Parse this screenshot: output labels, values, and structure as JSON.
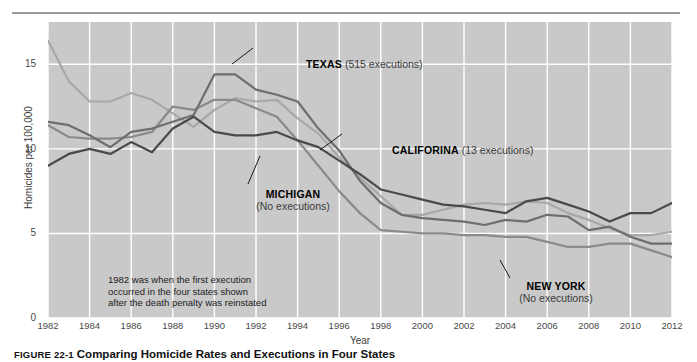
{
  "figure": {
    "caption_number": "FIGURE 22-1",
    "caption_text": "Comparing Homicide Rates and Executions in Four States"
  },
  "axes": {
    "y_title": "Homicides per 100,000",
    "x_title": "Year",
    "y_ticks": [
      "0",
      "5",
      "10",
      "15"
    ],
    "x_ticks": [
      "1982",
      "1984",
      "1986",
      "1988",
      "1990",
      "1992",
      "1994",
      "1996",
      "1998",
      "2000",
      "2002",
      "2004",
      "2006",
      "2008",
      "2010",
      "2012"
    ]
  },
  "annotations": {
    "texas": {
      "name": "TEXAS",
      "detail": "(515 executions)"
    },
    "california": {
      "name": "CALIFORINA",
      "detail": "(13 executions)"
    },
    "michigan": {
      "name": "MICHIGAN",
      "detail": "(No executions)"
    },
    "new_york": {
      "name": "NEW YORK",
      "detail": "(No executions)"
    },
    "note": "1982 was when the first execution\noccurred in the four states shown\nafter the death penalty was reinstated"
  },
  "colors": {
    "plot_background": "#c9c9c9",
    "gridline": "#ffffff",
    "texas": "#6e6e6e",
    "california": "#a8a8a8",
    "michigan": "#4a4a4a",
    "new_york": "#8a8a8a",
    "rule": "#9a9a9a"
  },
  "chart_data": {
    "type": "line",
    "title": "Comparing Homicide Rates and Executions in Four States",
    "xlabel": "Year",
    "ylabel": "Homicides per 100,000",
    "xlim": [
      1982,
      2012
    ],
    "ylim": [
      0,
      17.5
    ],
    "grid": true,
    "legend": "in-plot annotations",
    "x": [
      1982,
      1983,
      1984,
      1985,
      1986,
      1987,
      1988,
      1989,
      1990,
      1991,
      1992,
      1993,
      1994,
      1995,
      1996,
      1997,
      1998,
      1999,
      2000,
      2001,
      2002,
      2003,
      2004,
      2005,
      2006,
      2007,
      2008,
      2009,
      2010,
      2011,
      2012
    ],
    "series": [
      {
        "name": "TEXAS",
        "detail": "(515 executions)",
        "color": "#6e6e6e",
        "values": [
          11.6,
          11.4,
          10.8,
          10.1,
          11.0,
          11.2,
          11.6,
          12.0,
          14.4,
          14.4,
          13.5,
          13.2,
          12.8,
          11.2,
          9.9,
          8.1,
          6.8,
          6.1,
          5.9,
          5.8,
          5.7,
          5.5,
          5.8,
          5.7,
          6.1,
          6.0,
          5.2,
          5.4,
          4.8,
          4.4,
          4.4
        ]
      },
      {
        "name": "CALIFORINA",
        "detail": "(13 executions)",
        "color": "#a8a8a8",
        "values": [
          16.4,
          14.0,
          12.8,
          12.8,
          13.3,
          12.9,
          12.1,
          11.3,
          12.3,
          13.0,
          12.8,
          12.9,
          11.8,
          10.9,
          9.5,
          8.3,
          7.2,
          6.1,
          6.1,
          6.4,
          6.7,
          6.8,
          6.7,
          6.9,
          6.8,
          6.2,
          5.8,
          5.3,
          4.9,
          4.9,
          5.1
        ]
      },
      {
        "name": "MICHIGAN",
        "detail": "(No executions)",
        "color": "#4a4a4a",
        "values": [
          9.0,
          9.7,
          10.0,
          9.7,
          10.4,
          9.8,
          11.2,
          11.9,
          11.0,
          10.8,
          10.8,
          11.0,
          10.5,
          10.1,
          9.3,
          8.5,
          7.6,
          7.3,
          7.0,
          6.7,
          6.6,
          6.4,
          6.2,
          6.9,
          7.1,
          6.7,
          6.3,
          5.7,
          6.2,
          6.2,
          6.8
        ]
      },
      {
        "name": "NEW YORK",
        "detail": "(No executions)",
        "color": "#8a8a8a",
        "values": [
          11.4,
          10.7,
          10.6,
          10.6,
          10.7,
          11.0,
          12.5,
          12.3,
          12.9,
          12.9,
          12.4,
          11.9,
          10.5,
          9.0,
          7.5,
          6.2,
          5.2,
          5.1,
          5.0,
          5.0,
          4.9,
          4.9,
          4.8,
          4.8,
          4.5,
          4.2,
          4.2,
          4.4,
          4.4,
          4.0,
          3.6
        ]
      }
    ]
  }
}
